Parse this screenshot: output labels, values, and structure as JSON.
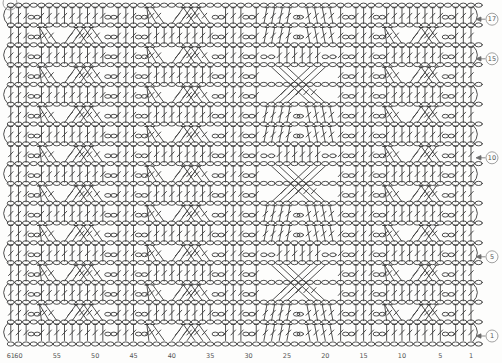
{
  "document": {
    "kind": "crochet-stitch-chart",
    "description": "Crochet cable pattern chart, 61 stitches wide, 17 rows tall, read right-to-left"
  },
  "chart": {
    "stitch_count": 61,
    "row_count": 17,
    "row_labels": [
      {
        "row": 17,
        "text": "17"
      },
      {
        "row": 15,
        "text": "15"
      },
      {
        "row": 10,
        "text": "10"
      },
      {
        "row": 5,
        "text": "5"
      },
      {
        "row": 1,
        "text": "1"
      }
    ],
    "column_labels": [
      {
        "col": 61,
        "text": "61"
      },
      {
        "col": 60,
        "text": "60"
      },
      {
        "col": 55,
        "text": "55"
      },
      {
        "col": 50,
        "text": "50"
      },
      {
        "col": 45,
        "text": "45"
      },
      {
        "col": 40,
        "text": "40"
      },
      {
        "col": 35,
        "text": "35"
      },
      {
        "col": 30,
        "text": "30"
      },
      {
        "col": 25,
        "text": "25"
      },
      {
        "col": 20,
        "text": "20"
      },
      {
        "col": 15,
        "text": "15"
      },
      {
        "col": 10,
        "text": "10"
      },
      {
        "col": 5,
        "text": "5"
      },
      {
        "col": 1,
        "text": "1"
      }
    ],
    "symbols": {
      "chain": "oval",
      "post": "treble-crochet-bar",
      "cable": "crossed-posts",
      "turning_chain": "edge-arc"
    },
    "panels": [
      {
        "type": "post",
        "cols": [
          61,
          60,
          59
        ]
      },
      {
        "type": "chain",
        "cols": [
          58
        ]
      },
      {
        "type": "braid",
        "from": 57,
        "to": 49,
        "cross_rows": "even"
      },
      {
        "type": "chain",
        "cols": [
          48
        ]
      },
      {
        "type": "post",
        "cols": [
          47,
          46,
          45
        ]
      },
      {
        "type": "chain",
        "cols": [
          44
        ]
      },
      {
        "type": "braid",
        "from": 43,
        "to": 35,
        "cross_rows": "odd"
      },
      {
        "type": "chain",
        "cols": [
          34
        ]
      },
      {
        "type": "post",
        "cols": [
          33,
          32,
          31
        ]
      },
      {
        "type": "chain",
        "cols": [
          30
        ]
      },
      {
        "type": "diamond",
        "from": 29,
        "to": 18,
        "cross_start_rows": [
          3,
          8,
          13
        ]
      },
      {
        "type": "chain",
        "cols": [
          17
        ]
      },
      {
        "type": "post",
        "cols": [
          16,
          15,
          14
        ]
      },
      {
        "type": "chain",
        "cols": [
          13
        ]
      },
      {
        "type": "braid",
        "from": 12,
        "to": 5,
        "cross_rows": "even"
      },
      {
        "type": "chain",
        "cols": [
          4
        ]
      },
      {
        "type": "post",
        "cols": [
          3,
          2,
          1
        ]
      }
    ],
    "geometry": {
      "width": 502,
      "height": 363,
      "origin_x": 471,
      "col_width": 7.67,
      "row1_center_y": 336,
      "row_height": 19.8,
      "foundation_chain_y": 344,
      "chart_left_x": 8,
      "chart_right_x": 473,
      "label_circle_x": 492,
      "label_circle_r": 6,
      "col_label_y": 357.5
    },
    "colors": {
      "line": "#3c3c3c",
      "label_text": "#555555",
      "label_circle": "#8a8a8a",
      "background": "#fdfdfc"
    }
  }
}
